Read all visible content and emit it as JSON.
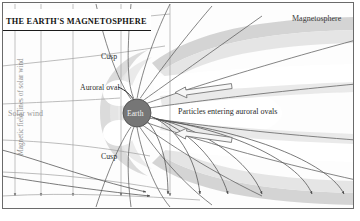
{
  "figure": {
    "title": "THE EARTH'S MAGNETOSPHERE",
    "width": 360,
    "height": 221,
    "background": "#ffffff",
    "frame_color": "#555555"
  },
  "labels": {
    "magnetosphere": "Magnetosphere",
    "cusp_top": "Cusp",
    "cusp_bottom": "Cusp",
    "auroral_oval": "Auroral oval",
    "earth": "Earth",
    "particles": "Particles entering auroral ovals",
    "solar_wind": "Solar wind",
    "magnetic_field_lines": "Magnetic field lines of solar wind"
  },
  "colors": {
    "earth_fill": "#767676",
    "earth_stroke": "#4a4a4a",
    "magnetosheath": "#c9c9c9",
    "magnetopause": "#dedede",
    "plasma_lobe": "#ffffff",
    "field_line": "#5a5a5a",
    "solar_wind_line": "#9e9e9e",
    "arrow": "#6b6b6b",
    "tail_band": "#d5d5d5",
    "title_text": "#121212",
    "label_text": "#2e2e2e",
    "faint_text": "#9a9a9a"
  },
  "elements": {
    "earth_center_x": 137,
    "earth_center_y": 113,
    "earth_radius": 14,
    "solar_wind_vertical_lines": 5,
    "solar_wind_horizontal_lines": 6,
    "magnetic_field_lines_count": 14,
    "particle_arrows_count": 2
  }
}
